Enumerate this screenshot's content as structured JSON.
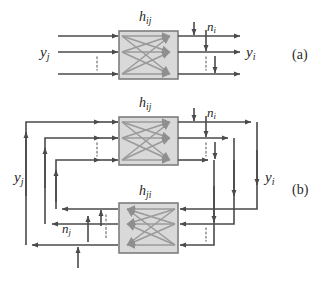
{
  "figure": {
    "colors": {
      "line": "#4a4a4a",
      "box_fill": "#d9d9d9",
      "box_stroke": "#7d7d7d",
      "cross_line": "#9a9a9a",
      "arrow_head": "#8f8f8f",
      "dotted": "#8a8a8a",
      "background": "#ffffff"
    },
    "panels": [
      {
        "tag": "(a)",
        "block_label_base": "h",
        "block_label_sub": "ij",
        "noise_label_base": "n",
        "noise_label_sub": "i",
        "input_label_base": "y",
        "input_label_sub": "j",
        "output_label_base": "y",
        "output_label_sub": "i",
        "num_lines": 3
      },
      {
        "tag": "(b)",
        "block_top_label_base": "h",
        "block_top_label_sub": "ij",
        "block_bottom_label_base": "h",
        "block_bottom_label_sub": "ji",
        "noise_top_label_base": "n",
        "noise_top_label_sub": "i",
        "noise_bottom_label_base": "n",
        "noise_bottom_label_sub": "j",
        "left_label_base": "y",
        "left_label_sub": "j",
        "right_label_base": "y",
        "right_label_sub": "i",
        "num_lines": 3
      }
    ]
  }
}
